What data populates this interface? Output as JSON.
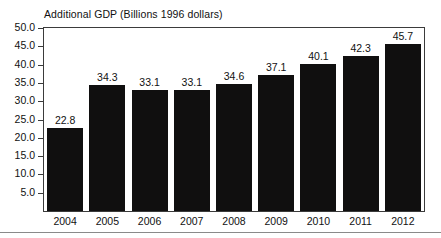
{
  "chart_data": {
    "type": "bar",
    "title": "Additional GDP (Billions 1996 dollars)",
    "xlabel": "",
    "ylabel": "",
    "categories": [
      "2004",
      "2005",
      "2006",
      "2007",
      "2008",
      "2009",
      "2010",
      "2011",
      "2012"
    ],
    "values": [
      22.8,
      34.3,
      33.1,
      33.1,
      34.6,
      37.1,
      40.1,
      42.3,
      45.7
    ],
    "value_labels": [
      "22.8",
      "34.3",
      "33.1",
      "33.1",
      "34.6",
      "37.1",
      "40.1",
      "42.3",
      "45.7"
    ],
    "ylim": [
      0.0,
      50.0
    ],
    "ytick_labels": [
      "50.0",
      "45.0",
      "40.0",
      "35.0",
      "30.0",
      "25.0",
      "20.0",
      "15.0",
      "10.0",
      "5.0"
    ],
    "ytick_values": [
      50.0,
      45.0,
      40.0,
      35.0,
      30.0,
      25.0,
      20.0,
      15.0,
      10.0,
      5.0
    ],
    "grid": false,
    "legend": null,
    "bar_color": "#100f0f",
    "axis_color": "#3b3b3b",
    "background_color": "#ffffff"
  }
}
